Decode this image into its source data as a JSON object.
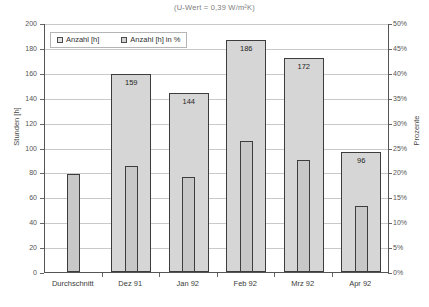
{
  "chart_data": {
    "type": "bar",
    "title": "(U-Wert = 0,39 W/m²K)",
    "xlabel": "",
    "ylabel": "Stunden [h]",
    "ylabel_secondary": "Prozente",
    "categories": [
      "Durchschnitt",
      "Dez 91",
      "Jan 92",
      "Feb 92",
      "Mrz 92",
      "Apr 92"
    ],
    "ylim": [
      0,
      200
    ],
    "ylim_secondary": [
      0,
      50
    ],
    "yticks": [
      0,
      20,
      40,
      60,
      80,
      100,
      120,
      140,
      160,
      180,
      200
    ],
    "ytick_labels": [
      "0",
      "20",
      "40",
      "60",
      "80",
      "100",
      "120",
      "140",
      "160",
      "180",
      "200"
    ],
    "yticks_secondary": [
      0,
      5,
      10,
      15,
      20,
      25,
      30,
      35,
      40,
      45,
      50
    ],
    "ytick_labels_secondary": [
      "0%",
      "5%",
      "10%",
      "15%",
      "20%",
      "25%",
      "30%",
      "35%",
      "40%",
      "45%",
      "50%"
    ],
    "grid": true,
    "legend_position": "top-left",
    "series": [
      {
        "name": "Anzahl [h]",
        "axis": "left",
        "values": [
          null,
          159,
          144,
          186,
          172,
          96
        ],
        "data_labels": [
          "",
          "159",
          "144",
          "186",
          "172",
          "96"
        ]
      },
      {
        "name": "Anzahl [h] in %",
        "axis": "right",
        "values": [
          19.8,
          21.3,
          19.0,
          26.3,
          22.5,
          13.3
        ],
        "values_as_hours": [
          79,
          85,
          76,
          105,
          90,
          53
        ],
        "data_labels": [
          "",
          "",
          "",
          "",
          "",
          ""
        ]
      }
    ]
  },
  "legend": {
    "entries": [
      {
        "label": "Anzahl [h]"
      },
      {
        "label": "Anzahl [h] in %"
      }
    ]
  },
  "colors": {
    "bar_hours_fill": "#d6d6d6",
    "bar_percent_fill": "#c8c8c8",
    "bar_outline": "#3d3d3d",
    "gridline": "#c9c9c9",
    "axis": "#555555",
    "title_text": "#7d7d7d"
  }
}
